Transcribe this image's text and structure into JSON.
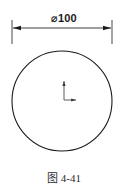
{
  "figure": {
    "type": "engineering-drawing",
    "background_color": "#ffffff",
    "line_color": "#1a1a1a",
    "dimension": {
      "label": "⌀100",
      "symbol_name": "diameter-symbol",
      "value": 100,
      "unit": "mm",
      "line_y": 28,
      "left_x": 12,
      "right_x": 112,
      "arrow_style": "filled-closed",
      "extension_line_top_y": 20,
      "extension_line_bottom_y": 44
    },
    "circle": {
      "name": "outer-circle",
      "center_x": 62,
      "center_y": 101,
      "radius": 50,
      "stroke_width": 1.1
    },
    "origin_axes": {
      "name": "origin-axis-indicator",
      "origin_x": 64,
      "origin_y": 100,
      "x_axis_length": 13,
      "y_axis_length": 20,
      "x_axis_direction": "right",
      "y_axis_direction": "up"
    },
    "caption": {
      "text": "图 4-41",
      "y": 170
    }
  }
}
